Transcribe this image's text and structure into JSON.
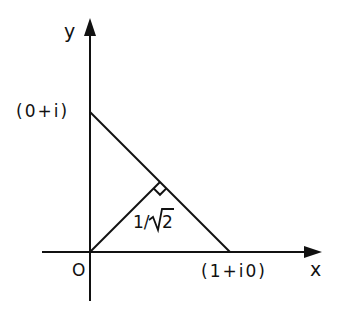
{
  "diagram": {
    "type": "complex-plane-geometry",
    "axes": {
      "x_label": "x",
      "y_label": "y",
      "origin_label": "O"
    },
    "points": {
      "y_intercept": {
        "label": "(0+i)",
        "complex": "0+i",
        "re": 0,
        "im": 1
      },
      "x_intercept": {
        "label": "(1+i0)",
        "complex": "1+i0",
        "re": 1,
        "im": 0
      },
      "perpendicular_foot": {
        "re": 0.5,
        "im": 0.5
      }
    },
    "segments": [
      {
        "name": "line-segment",
        "from": "(0+i)",
        "to": "(1+i0)"
      },
      {
        "name": "perpendicular",
        "from": "O",
        "to": "perpendicular_foot",
        "length_label": "1/√2",
        "length": 0.7071
      }
    ],
    "annotations": {
      "right_angle_marker": true,
      "distance_label": "1/√2",
      "distance_numerator": "1/",
      "distance_radicand": "2"
    },
    "colors": {
      "ink": "#111111",
      "background": "#ffffff"
    }
  }
}
